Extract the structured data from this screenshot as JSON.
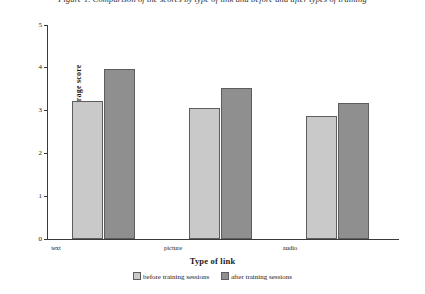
{
  "caption": "Figure 1. Comparison of the scores by type of link and before and after types of training",
  "chart_data": {
    "type": "bar",
    "title": "",
    "xlabel": "Type of link",
    "ylabel": "Average score",
    "categories": [
      "text",
      "picture",
      "audio"
    ],
    "series": [
      {
        "name": "before training sessions",
        "values": [
          3.22,
          3.05,
          2.87
        ],
        "color": "#c9c9c9"
      },
      {
        "name": "after training sessions",
        "values": [
          3.97,
          3.53,
          3.17
        ],
        "color": "#8f8f8f"
      }
    ],
    "ylim": [
      0,
      5
    ],
    "yticks": [
      "0",
      "1",
      "2",
      "3",
      "4",
      "5"
    ],
    "grid": false,
    "legend_position": "bottom"
  }
}
